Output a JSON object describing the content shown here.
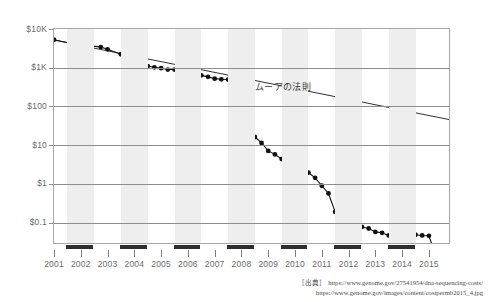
{
  "chart_data": {
    "type": "line",
    "title": "",
    "subtitle": "",
    "xlabel": "",
    "ylabel": "",
    "yscale": "log",
    "ylim": [
      0.03,
      10000
    ],
    "xlim": [
      2001.0,
      2015.75
    ],
    "grid": true,
    "legend_position": "inline-annotation",
    "ytick_labels": [
      "$10K",
      "$1K",
      "$100",
      "$10",
      "$1",
      "$0.1"
    ],
    "ytick_values": [
      10000,
      1000,
      100,
      10,
      1,
      0.1
    ],
    "xtick_labels": [
      "2001",
      "2002",
      "2003",
      "2004",
      "2005",
      "2006",
      "2007",
      "2008",
      "2009",
      "2010",
      "2011",
      "2012",
      "2013",
      "2014",
      "2015"
    ],
    "xtick_values": [
      2001,
      2002,
      2003,
      2004,
      2005,
      2006,
      2007,
      2008,
      2009,
      2010,
      2011,
      2012,
      2013,
      2014,
      2015
    ],
    "annotations": [
      {
        "text": "ムーアの法則",
        "x": 2010.3,
        "y": 330
      }
    ],
    "series": [
      {
        "name": "cost-per-megabase",
        "marker": "filled-circle",
        "color": "#111111",
        "points": [
          {
            "x": 2001.0,
            "y": 5292.39
          },
          {
            "x": 2001.75,
            "y": 4100.0
          },
          {
            "x": 2002.0,
            "y": 3898.64
          },
          {
            "x": 2002.25,
            "y": 3768.0
          },
          {
            "x": 2002.75,
            "y": 3413.8
          },
          {
            "x": 2003.0,
            "y": 2986.2
          },
          {
            "x": 2003.5,
            "y": 2230.98
          },
          {
            "x": 2003.75,
            "y": 2000.0
          },
          {
            "x": 2004.0,
            "y": 1598.91
          },
          {
            "x": 2004.25,
            "y": 1135.7
          },
          {
            "x": 2004.5,
            "y": 1107.46
          },
          {
            "x": 2004.75,
            "y": 1028.0
          },
          {
            "x": 2005.0,
            "y": 974.16
          },
          {
            "x": 2005.25,
            "y": 897.76
          },
          {
            "x": 2005.5,
            "y": 898.9
          },
          {
            "x": 2005.75,
            "y": 766.73
          },
          {
            "x": 2006.0,
            "y": 699.2
          },
          {
            "x": 2006.25,
            "y": 651.81
          },
          {
            "x": 2006.5,
            "y": 636.41
          },
          {
            "x": 2006.75,
            "y": 581.92
          },
          {
            "x": 2007.0,
            "y": 522.71
          },
          {
            "x": 2007.25,
            "y": 502.61
          },
          {
            "x": 2007.5,
            "y": 495.96
          },
          {
            "x": 2007.75,
            "y": 397.09
          },
          {
            "x": 2008.0,
            "y": 102.13
          },
          {
            "x": 2008.25,
            "y": 29.92
          },
          {
            "x": 2008.5,
            "y": 16.3
          },
          {
            "x": 2008.75,
            "y": 11.5
          },
          {
            "x": 2009.0,
            "y": 7.15
          },
          {
            "x": 2009.25,
            "y": 5.81
          },
          {
            "x": 2009.5,
            "y": 4.4
          },
          {
            "x": 2009.75,
            "y": 3.63
          },
          {
            "x": 2010.0,
            "y": 2.59
          },
          {
            "x": 2010.25,
            "y": 2.4
          },
          {
            "x": 2010.5,
            "y": 1.97
          },
          {
            "x": 2010.75,
            "y": 1.44
          },
          {
            "x": 2011.0,
            "y": 0.9
          },
          {
            "x": 2011.25,
            "y": 0.57
          },
          {
            "x": 2011.5,
            "y": 0.19
          },
          {
            "x": 2011.75,
            "y": 0.12
          },
          {
            "x": 2012.0,
            "y": 0.09
          },
          {
            "x": 2012.25,
            "y": 0.093
          },
          {
            "x": 2012.5,
            "y": 0.078
          },
          {
            "x": 2012.75,
            "y": 0.071
          },
          {
            "x": 2013.0,
            "y": 0.058
          },
          {
            "x": 2013.25,
            "y": 0.055
          },
          {
            "x": 2013.5,
            "y": 0.047
          },
          {
            "x": 2013.75,
            "y": 0.042
          },
          {
            "x": 2014.0,
            "y": 0.052
          },
          {
            "x": 2014.25,
            "y": 0.062
          },
          {
            "x": 2014.5,
            "y": 0.049
          },
          {
            "x": 2014.75,
            "y": 0.047
          },
          {
            "x": 2015.0,
            "y": 0.046
          },
          {
            "x": 2015.25,
            "y": 0.0145
          },
          {
            "x": 2015.5,
            "y": 0.0145
          }
        ]
      },
      {
        "name": "moores-law",
        "marker": "none",
        "color": "#1a1a1a",
        "points": [
          {
            "x": 2001.05,
            "y": 5100.0
          },
          {
            "x": 2015.75,
            "y": 46.0
          }
        ]
      }
    ]
  },
  "caption": {
    "prefix": "［出典］",
    "line1": "https://www.genome.gov/27541954/dna-sequencing-costs/",
    "line2": "https://www.genome.gov/images/content/costpermb2015_4.jpg"
  }
}
